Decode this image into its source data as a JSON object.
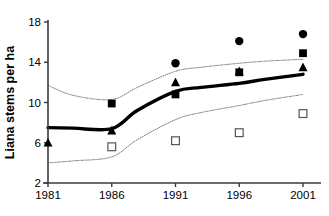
{
  "chart_data": {
    "type": "scatter",
    "title": "",
    "subtitle": "",
    "xlabel": "",
    "ylabel": "Liana stems per ha",
    "x": [
      1981,
      1986,
      1991,
      1996,
      2001
    ],
    "categories": [
      "1981",
      "1986",
      "1991",
      "1996",
      "2001"
    ],
    "xtick_labels": [
      "1981",
      "1986",
      "1991",
      "1996",
      "2001"
    ],
    "ytick_labels": [
      "2",
      "6",
      "10",
      "14",
      "18"
    ],
    "ytick_values": [
      2,
      6,
      10,
      14,
      18
    ],
    "xlim": [
      1981,
      2001
    ],
    "ylim": [
      2,
      18
    ],
    "grid": false,
    "legend": false,
    "legend_position": "none",
    "series": [
      {
        "name": "filled-triangle",
        "marker": "triangle-filled",
        "color": "#000000",
        "x": [
          1981,
          1986,
          1991,
          1996,
          2001
        ],
        "values": [
          6.0,
          7.2,
          12.0,
          13.1,
          13.5
        ]
      },
      {
        "name": "filled-square",
        "marker": "square-filled",
        "color": "#000000",
        "x": [
          1986,
          1991,
          1996,
          2001
        ],
        "values": [
          9.9,
          10.8,
          13.0,
          14.9
        ]
      },
      {
        "name": "filled-circle",
        "marker": "circle-filled",
        "color": "#000000",
        "x": [
          1991,
          1996,
          2001
        ],
        "values": [
          13.9,
          16.1,
          16.8
        ]
      },
      {
        "name": "open-square",
        "marker": "square-open",
        "color": "#555555",
        "x": [
          1986,
          1991,
          1996,
          2001
        ],
        "values": [
          5.6,
          6.2,
          7.0,
          8.9
        ]
      },
      {
        "name": "fitted-curve",
        "marker": "none",
        "line": "solid-thick",
        "color": "#000000",
        "x": [
          1981,
          1983,
          1986,
          1988,
          1991,
          1993,
          1996,
          1998,
          2001
        ],
        "values": [
          7.5,
          7.45,
          7.4,
          9.2,
          11.1,
          11.5,
          11.9,
          12.3,
          12.8
        ]
      },
      {
        "name": "upper-confidence-band",
        "marker": "none",
        "line": "dotted",
        "color": "#7a7a7a",
        "x": [
          1981,
          1983,
          1986,
          1988,
          1991,
          1993,
          1996,
          1998,
          2001
        ],
        "values": [
          11.7,
          10.7,
          10.3,
          11.5,
          13.1,
          13.5,
          13.9,
          14.1,
          14.3
        ]
      },
      {
        "name": "lower-confidence-band",
        "marker": "none",
        "line": "dotted",
        "color": "#7a7a7a",
        "x": [
          1981,
          1983,
          1986,
          1988,
          1991,
          1993,
          1996,
          1998,
          2001
        ],
        "values": [
          4.0,
          4.2,
          4.6,
          6.3,
          8.3,
          9.0,
          9.7,
          10.2,
          10.8
        ]
      }
    ]
  },
  "axes": {
    "y_title": "Liana stems per ha",
    "y_ticks": [
      "18",
      "14",
      "10",
      "6",
      "2"
    ],
    "x_ticks": [
      "1981",
      "1986",
      "1991",
      "1996",
      "2001"
    ]
  },
  "colors": {
    "marker_fill": "#000000",
    "marker_open_stroke": "#555555",
    "axis": "#3a3a3a",
    "band": "#7a7a7a",
    "curve": "#000000",
    "background": "#ffffff"
  }
}
